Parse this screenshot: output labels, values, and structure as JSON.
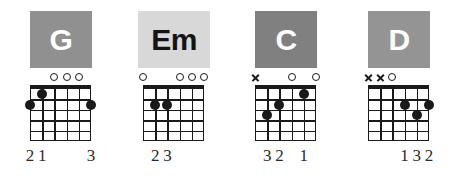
{
  "page": {
    "background": "#ffffff",
    "ink": "#1a1a1a",
    "strings": 6,
    "frets": 5
  },
  "legend": {
    "open_symbol": "o",
    "muted_symbol": "x"
  },
  "chords": [
    {
      "name": "G",
      "plate_bg": "#909090",
      "plate_fg": "#ffffff",
      "markers": [
        "",
        "",
        "o",
        "o",
        "o",
        ""
      ],
      "dots": [
        {
          "string": 1,
          "fret": 2
        },
        {
          "string": 2,
          "fret": 1
        },
        {
          "string": 6,
          "fret": 2
        }
      ],
      "fingers": [
        {
          "string": 1,
          "label": "2"
        },
        {
          "string": 2,
          "label": "1"
        },
        {
          "string": 6,
          "label": "3"
        }
      ]
    },
    {
      "name": "Em",
      "plate_bg": "#d8d8d8",
      "plate_fg": "#141414",
      "markers": [
        "o",
        "",
        "",
        "o",
        "o",
        "o"
      ],
      "dots": [
        {
          "string": 2,
          "fret": 2
        },
        {
          "string": 3,
          "fret": 2
        }
      ],
      "fingers": [
        {
          "string": 2,
          "label": "2"
        },
        {
          "string": 3,
          "label": "3"
        }
      ]
    },
    {
      "name": "C",
      "plate_bg": "#808080",
      "plate_fg": "#ffffff",
      "markers": [
        "x",
        "",
        "",
        "o",
        "",
        "o"
      ],
      "dots": [
        {
          "string": 2,
          "fret": 3
        },
        {
          "string": 3,
          "fret": 2
        },
        {
          "string": 5,
          "fret": 1
        }
      ],
      "fingers": [
        {
          "string": 2,
          "label": "3"
        },
        {
          "string": 3,
          "label": "2"
        },
        {
          "string": 5,
          "label": "1"
        }
      ]
    },
    {
      "name": "D",
      "plate_bg": "#949494",
      "plate_fg": "#ffffff",
      "markers": [
        "x",
        "x",
        "o",
        "",
        "",
        ""
      ],
      "dots": [
        {
          "string": 4,
          "fret": 2
        },
        {
          "string": 5,
          "fret": 3
        },
        {
          "string": 6,
          "fret": 2
        }
      ],
      "fingers": [
        {
          "string": 4,
          "label": "1"
        },
        {
          "string": 5,
          "label": "3"
        },
        {
          "string": 6,
          "label": "2"
        }
      ]
    }
  ],
  "layout": {
    "chord_x": [
      30,
      143,
      255,
      368
    ]
  }
}
